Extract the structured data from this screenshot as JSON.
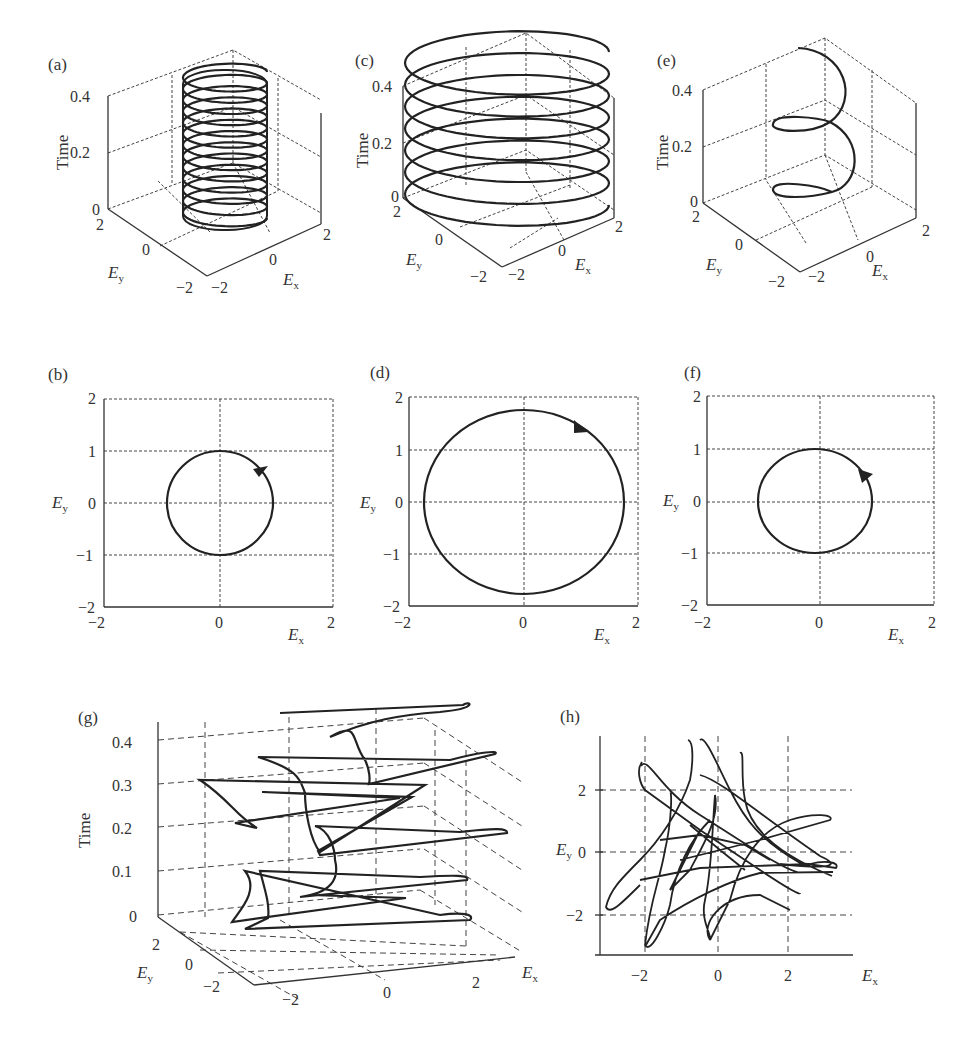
{
  "figure": {
    "panels": {
      "a": {
        "label": "(a)",
        "type": "3d-helix",
        "zlabel": "Time",
        "xlabel": "E",
        "xsub": "x",
        "ylabel": "E",
        "ysub": "y",
        "zticks": [
          "0",
          "0.2",
          "0.4"
        ],
        "xticks": [
          "-2",
          "0",
          "2"
        ],
        "yticks": [
          "2",
          "0",
          "-2"
        ]
      },
      "b": {
        "label": "(b)",
        "type": "polarization-ellipse",
        "xlabel": "E",
        "xsub": "x",
        "ylabel": "E",
        "ysub": "y",
        "xticks": [
          "-2",
          "0",
          "2"
        ],
        "yticks": [
          "2",
          "1",
          "0",
          "-1",
          "-2"
        ]
      },
      "c": {
        "label": "(c)",
        "type": "3d-helix",
        "zlabel": "Time",
        "xlabel": "E",
        "xsub": "x",
        "ylabel": "E",
        "ysub": "y",
        "zticks": [
          "0",
          "0.2",
          "0.4"
        ],
        "xticks": [
          "-2",
          "0",
          "2"
        ],
        "yticks": [
          "2",
          "0",
          "-2"
        ]
      },
      "d": {
        "label": "(d)",
        "type": "polarization-ellipse",
        "xlabel": "E",
        "xsub": "x",
        "ylabel": "E",
        "ysub": "y",
        "xticks": [
          "-2",
          "0",
          "2"
        ],
        "yticks": [
          "2",
          "1",
          "0",
          "-1",
          "-2"
        ]
      },
      "e": {
        "label": "(e)",
        "type": "3d-helix",
        "zlabel": "Time",
        "xlabel": "E",
        "xsub": "x",
        "ylabel": "E",
        "ysub": "y",
        "zticks": [
          "0",
          "0.2",
          "0.4"
        ],
        "xticks": [
          "-2",
          "0",
          "2"
        ],
        "yticks": [
          "2",
          "0",
          "-2"
        ]
      },
      "f": {
        "label": "(f)",
        "type": "polarization-ellipse",
        "xlabel": "E",
        "xsub": "x",
        "ylabel": "E",
        "ysub": "y",
        "xticks": [
          "-2",
          "0",
          "2"
        ],
        "yticks": [
          "2",
          "1",
          "0",
          "-1",
          "-2"
        ]
      },
      "g": {
        "label": "(g)",
        "type": "3d-trajectory",
        "zlabel": "Time",
        "xlabel": "E",
        "xsub": "x",
        "ylabel": "E",
        "ysub": "y",
        "zticks": [
          "0",
          "0.1",
          "0.2",
          "0.3",
          "0.4"
        ],
        "xticks": [
          "-2",
          "0",
          "2"
        ],
        "yticks": [
          "2",
          "0",
          "-2"
        ]
      },
      "h": {
        "label": "(h)",
        "type": "2d-trajectory",
        "xlabel": "E",
        "xsub": "x",
        "ylabel": "E",
        "ysub": "y",
        "xticks": [
          "-2",
          "0",
          "2"
        ],
        "yticks": [
          "2",
          "0",
          "-2"
        ]
      }
    }
  },
  "chart_data": [
    {
      "panel": "a",
      "type": "line",
      "title": "",
      "xlabel": "Ex",
      "ylabel": "Ey",
      "zlabel": "Time",
      "description": "Circular helix, radius 1, ~13 turns over time 0 to 0.4",
      "radius_x": 1.0,
      "radius_y": 1.0,
      "turns": 13,
      "zlim": [
        0,
        0.4
      ],
      "xlim": [
        -2,
        2
      ],
      "ylim": [
        -2,
        2
      ]
    },
    {
      "panel": "b",
      "type": "line",
      "title": "",
      "xlabel": "Ex",
      "ylabel": "Ey",
      "description": "Circle of radius 1 centered at origin, arrow indicating counterclockwise rotation",
      "center": [
        0,
        0
      ],
      "radius_x": 1.0,
      "radius_y": 1.0,
      "direction": "counterclockwise",
      "xlim": [
        -2,
        2
      ],
      "ylim": [
        -2,
        2
      ],
      "grid": true
    },
    {
      "panel": "c",
      "type": "line",
      "title": "",
      "xlabel": "Ex",
      "ylabel": "Ey",
      "zlabel": "Time",
      "description": "Circular helix, radius ~1.8, ~7 turns over time 0 to 0.4",
      "radius_x": 1.8,
      "radius_y": 1.8,
      "turns": 7,
      "zlim": [
        0,
        0.4
      ],
      "xlim": [
        -2,
        2
      ],
      "ylim": [
        -2,
        2
      ]
    },
    {
      "panel": "d",
      "type": "line",
      "title": "",
      "xlabel": "Ex",
      "ylabel": "Ey",
      "description": "Circle of radius ~1.75 centered at origin, arrow indicating clockwise rotation",
      "center": [
        0,
        0
      ],
      "radius_x": 1.75,
      "radius_y": 1.75,
      "direction": "clockwise",
      "xlim": [
        -2,
        2
      ],
      "ylim": [
        -2,
        2
      ],
      "grid": true
    },
    {
      "panel": "e",
      "type": "line",
      "title": "",
      "xlabel": "Ex",
      "ylabel": "Ey",
      "zlabel": "Time",
      "description": "Circular helix, radius 1, ~2.5 turns over time 0 to 0.4",
      "radius_x": 1.0,
      "radius_y": 1.0,
      "turns": 2.5,
      "zlim": [
        0,
        0.4
      ],
      "xlim": [
        -2,
        2
      ],
      "ylim": [
        -2,
        2
      ]
    },
    {
      "panel": "f",
      "type": "line",
      "title": "",
      "xlabel": "Ex",
      "ylabel": "Ey",
      "description": "Circle of radius 1 centered near origin, arrow indicating counterclockwise rotation",
      "center": [
        -0.1,
        0
      ],
      "radius_x": 1.05,
      "radius_y": 1.0,
      "direction": "counterclockwise",
      "xlim": [
        -2,
        2
      ],
      "ylim": [
        -2,
        2
      ],
      "grid": true
    },
    {
      "panel": "g",
      "type": "line",
      "title": "",
      "xlabel": "Ex",
      "ylabel": "Ey",
      "zlabel": "Time",
      "description": "Irregular 3D trajectory with cusps and loops over time 0 to 0.45",
      "zlim": [
        0,
        0.45
      ],
      "xlim": [
        -3,
        3
      ],
      "ylim": [
        -3,
        3
      ]
    },
    {
      "panel": "h",
      "type": "line",
      "title": "",
      "xlabel": "Ex",
      "ylabel": "Ey",
      "description": "Chaotic 2D projection of trajectory (g) with many loops and cusps",
      "xlim": [
        -3.2,
        3.8
      ],
      "ylim": [
        -3.2,
        3.5
      ],
      "grid": true
    }
  ]
}
